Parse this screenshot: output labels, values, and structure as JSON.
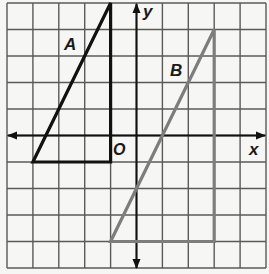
{
  "diagram": {
    "type": "coordinate-grid",
    "grid": {
      "xmin": -5,
      "xmax": 5,
      "ymin": -5,
      "ymax": 5,
      "step": 1
    },
    "axes": {
      "x_label": "x",
      "y_label": "y",
      "origin_label": "O"
    },
    "figures": [
      {
        "name": "A",
        "label": "A",
        "color": "#111111",
        "vertices": [
          [
            -1,
            5
          ],
          [
            -4,
            -1
          ],
          [
            -1,
            -1
          ]
        ],
        "label_pos": [
          -2.6,
          3.5
        ]
      },
      {
        "name": "B",
        "label": "B",
        "color": "#7d7d7d",
        "vertices": [
          [
            3,
            4
          ],
          [
            -1,
            -4
          ],
          [
            3,
            -4
          ]
        ],
        "label_pos": [
          1.6,
          2.5
        ]
      }
    ],
    "colors": {
      "grid": "#5a5a5a",
      "axis": "#111111",
      "background": "#f6f6f4"
    }
  }
}
